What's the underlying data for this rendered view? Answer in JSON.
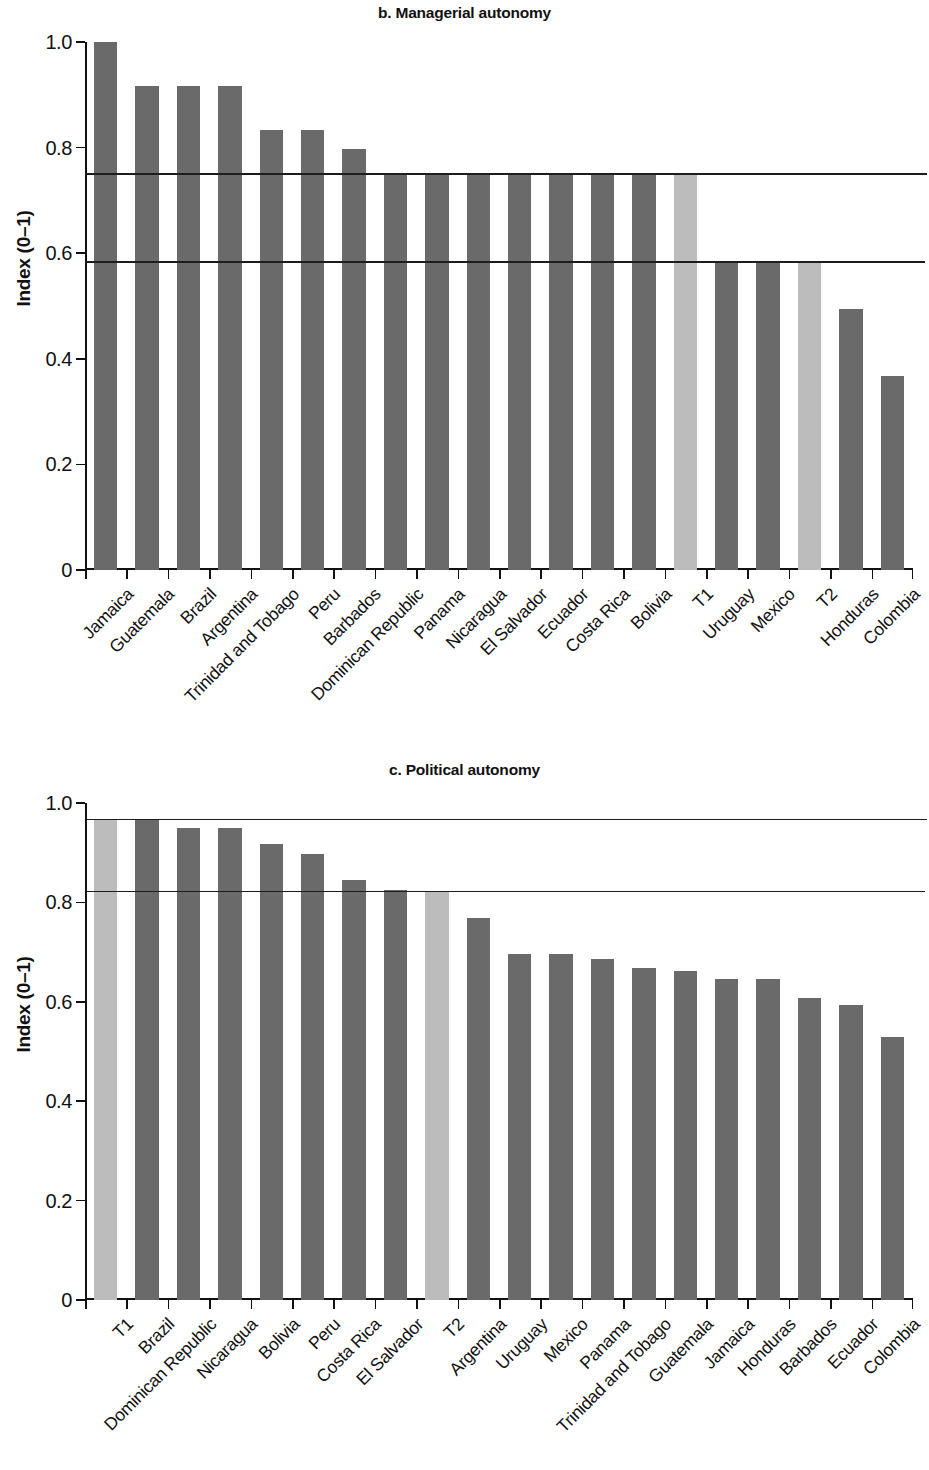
{
  "figure": {
    "ylabel": "Index (0–1)"
  },
  "panels": [
    {
      "id": "panel-b",
      "title": "b. Managerial autonomy"
    },
    {
      "id": "panel-c",
      "title": "c. Political autonomy"
    }
  ],
  "chart_data": [
    {
      "type": "bar",
      "title": "b. Managerial autonomy",
      "xlabel": "",
      "ylabel": "Index (0–1)",
      "ylim": [
        0,
        1.0
      ],
      "yticks": [
        0,
        0.2,
        0.4,
        0.6,
        0.8,
        1.0
      ],
      "ytick_labels": [
        "0",
        "0.2",
        "0.4",
        "0.6",
        "0.8",
        "1.0"
      ],
      "grid": false,
      "legend": null,
      "reference_lines": [
        {
          "value": 0.75,
          "label": "T1"
        },
        {
          "value": 0.583,
          "label": "T2"
        }
      ],
      "highlight_color": "#bcbcbc",
      "bar_color": "#6a6a6a",
      "categories": [
        "Jamaica",
        "Guatemala",
        "Brazil",
        "Argentina",
        "Trinidad and Tobago",
        "Peru",
        "Barbados",
        "Dominican Republic",
        "Panama",
        "Nicaragua",
        "El Salvador",
        "Ecuador",
        "Costa Rica",
        "Bolivia",
        "T1",
        "Uruguay",
        "Mexico",
        "T2",
        "Honduras",
        "Colombia"
      ],
      "values": [
        1.0,
        0.917,
        0.917,
        0.917,
        0.833,
        0.833,
        0.797,
        0.75,
        0.75,
        0.75,
        0.75,
        0.75,
        0.75,
        0.75,
        0.75,
        0.583,
        0.583,
        0.583,
        0.495,
        0.368
      ],
      "highlighted": [
        false,
        false,
        false,
        false,
        false,
        false,
        false,
        false,
        false,
        false,
        false,
        false,
        false,
        false,
        true,
        false,
        false,
        true,
        false,
        false
      ]
    },
    {
      "type": "bar",
      "title": "c. Political autonomy",
      "xlabel": "",
      "ylabel": "Index (0–1)",
      "ylim": [
        0,
        1.0
      ],
      "yticks": [
        0,
        0.2,
        0.4,
        0.6,
        0.8,
        1.0
      ],
      "ytick_labels": [
        "0",
        "0.2",
        "0.4",
        "0.6",
        "0.8",
        "1.0"
      ],
      "grid": false,
      "legend": null,
      "reference_lines": [
        {
          "value": 0.967,
          "label": "T1"
        },
        {
          "value": 0.822,
          "label": "T2"
        }
      ],
      "highlight_color": "#bcbcbc",
      "bar_color": "#6a6a6a",
      "categories": [
        "T1",
        "Brazil",
        "Dominican Republic",
        "Nicaragua",
        "Bolivia",
        "Peru",
        "Costa Rica",
        "El Salvador",
        "T2",
        "Argentina",
        "Uruguay",
        "Mexico",
        "Panama",
        "Trinidad and Tobago",
        "Guatemala",
        "Jamaica",
        "Honduras",
        "Barbados",
        "Ecuador",
        "Colombia"
      ],
      "values": [
        0.967,
        0.967,
        0.949,
        0.949,
        0.918,
        0.898,
        0.846,
        0.824,
        0.822,
        0.768,
        0.697,
        0.697,
        0.687,
        0.668,
        0.663,
        0.646,
        0.646,
        0.608,
        0.594,
        0.53
      ],
      "highlighted": [
        true,
        false,
        false,
        false,
        false,
        false,
        false,
        false,
        true,
        false,
        false,
        false,
        false,
        false,
        false,
        false,
        false,
        false,
        false,
        false
      ]
    }
  ]
}
